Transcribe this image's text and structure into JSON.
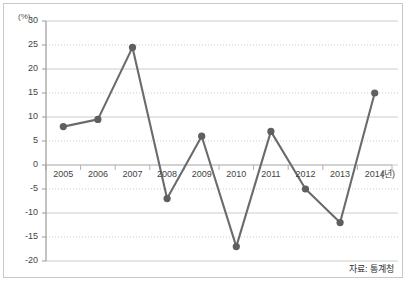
{
  "figure": {
    "y_axis_unit": "(%)",
    "x_axis_unit": "(년)",
    "source_note": "자료: 통계청",
    "line_color": "#6b6b6b",
    "marker_color": "#5f5f5f",
    "gridline_color": "#cccccc",
    "axis_color": "#999999",
    "frame_color": "#c8c8c8"
  },
  "chart_data": {
    "type": "line",
    "title": "",
    "subtitle": "",
    "xlabel": "(년)",
    "ylabel": "(%)",
    "categories": [
      "2005",
      "2006",
      "2007",
      "2008",
      "2009",
      "2010",
      "2011",
      "2012",
      "2013",
      "2014"
    ],
    "x": [
      2005,
      2006,
      2007,
      2008,
      2009,
      2010,
      2011,
      2012,
      2013,
      2014
    ],
    "values": [
      8,
      9.5,
      24.5,
      -7,
      6,
      -17,
      7,
      -5,
      -12,
      15
    ],
    "series": [
      {
        "name": "",
        "values": [
          8,
          9.5,
          24.5,
          -7,
          6,
          -17,
          7,
          -5,
          -12,
          15
        ]
      }
    ],
    "ylim": [
      -20,
      30
    ],
    "yticks": [
      30,
      25,
      20,
      15,
      10,
      5,
      0,
      -5,
      -10,
      -15,
      -20
    ],
    "ytick_labels": [
      "30",
      "25",
      "20",
      "15",
      "10",
      "5",
      "0",
      "-5",
      "-10",
      "-15",
      "-20"
    ],
    "xtick_labels": [
      "2005",
      "2006",
      "2007",
      "2008",
      "2009",
      "2010",
      "2011",
      "2012",
      "2013",
      "2014"
    ],
    "grid": true,
    "grid_axis": "y",
    "legend": false,
    "legend_position": "none",
    "annotations": [
      "자료: 통계청"
    ],
    "markers": "circle",
    "marker_size": 6
  }
}
